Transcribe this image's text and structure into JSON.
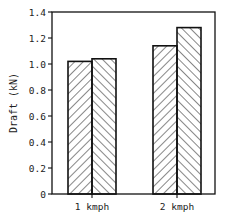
{
  "chart_data": {
    "type": "bar",
    "title": "",
    "xlabel": "",
    "ylabel": "Draft (kN)",
    "ylim": [
      0,
      1.4
    ],
    "yticks": [
      0,
      0.2,
      0.4,
      0.6,
      0.8,
      1.0,
      1.2,
      1.4
    ],
    "ytick_labels": [
      "0",
      "0.2",
      "0.4",
      "0.6",
      "0.8",
      "1.0",
      "1.2",
      "1.4"
    ],
    "categories": [
      "1 kmph",
      "2 kmph"
    ],
    "series": [
      {
        "name": "Series A (right-hatched)",
        "hatch": "forward-diagonal",
        "values": [
          1.02,
          1.14
        ]
      },
      {
        "name": "Series B (left-hatched)",
        "hatch": "backward-diagonal",
        "values": [
          1.04,
          1.28
        ]
      }
    ],
    "grid": false,
    "legend": "none",
    "colors": {
      "stroke": "#111111",
      "fill": "#ffffff",
      "hatch": "#222222"
    }
  }
}
